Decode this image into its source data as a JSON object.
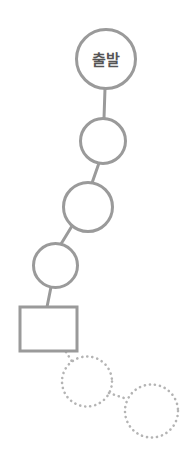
{
  "diagram": {
    "type": "flow-path",
    "title": "",
    "canvas": {
      "width": 188,
      "height": 466,
      "background": "#ffffff"
    },
    "style": {
      "stroke_color": "#9a9a9a",
      "dotted_stroke_color": "#b4b4b4",
      "label_color": "#555555",
      "fill_color": "#ffffff",
      "solid_stroke_width": 3,
      "dotted_stroke_width": 2.6,
      "connector_stroke_width": 3
    },
    "nodes": [
      {
        "id": "node-start",
        "shape": "circle",
        "label": "출발",
        "label_font_size": 15,
        "cx": 106,
        "cy": 59,
        "r": 29.5,
        "state": "solid",
        "order": 1
      },
      {
        "id": "node-2",
        "shape": "circle",
        "label": "",
        "cx": 103,
        "cy": 141,
        "r": 22.5,
        "state": "solid",
        "order": 2
      },
      {
        "id": "node-3",
        "shape": "circle",
        "label": "",
        "cx": 88,
        "cy": 207,
        "r": 24.5,
        "state": "solid",
        "order": 3
      },
      {
        "id": "node-4",
        "shape": "circle",
        "label": "",
        "cx": 55.5,
        "cy": 265.5,
        "r": 22,
        "state": "solid",
        "order": 4
      },
      {
        "id": "node-rect",
        "shape": "rectangle",
        "label": "",
        "x": 20,
        "y": 307,
        "width": 57,
        "height": 44,
        "state": "solid",
        "order": 5
      },
      {
        "id": "node-ghost-1",
        "shape": "circle",
        "label": "",
        "cx": 87,
        "cy": 381.5,
        "r": 25,
        "state": "dotted",
        "order": 6
      },
      {
        "id": "node-ghost-2",
        "shape": "circle",
        "label": "",
        "cx": 151.5,
        "cy": 411,
        "r": 26.5,
        "state": "dotted",
        "order": 7
      }
    ],
    "connectors": [
      {
        "id": "link-1-2",
        "from": "node-start",
        "to": "node-2",
        "x1": 105,
        "y1": 88.5,
        "x2": 104,
        "y2": 118.5,
        "state": "solid"
      },
      {
        "id": "link-2-3",
        "from": "node-2",
        "to": "node-3",
        "x1": 99,
        "y1": 163,
        "x2": 92,
        "y2": 183,
        "state": "solid"
      },
      {
        "id": "link-3-4",
        "from": "node-3",
        "to": "node-4",
        "x1": 72,
        "y1": 226,
        "x2": 61,
        "y2": 244,
        "state": "solid"
      },
      {
        "id": "link-4-rect",
        "from": "node-4",
        "to": "node-rect",
        "x1": 51,
        "y1": 287,
        "x2": 47,
        "y2": 307,
        "state": "solid"
      },
      {
        "id": "link-rect-ghost1",
        "from": "node-rect",
        "to": "node-ghost-1",
        "x1": 66,
        "y1": 352,
        "x2": 73,
        "y2": 363,
        "state": "dotted"
      },
      {
        "id": "link-ghost1-ghost2",
        "from": "node-ghost-1",
        "to": "node-ghost-2",
        "x1": 109,
        "y1": 393,
        "x2": 127,
        "y2": 399,
        "state": "dotted"
      }
    ]
  }
}
